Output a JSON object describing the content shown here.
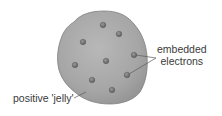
{
  "labels": {
    "electrons_line1": "embedded",
    "electrons_line2": "electrons",
    "jelly": "positive 'jelly'"
  },
  "colors": {
    "jelly_fill": "#a9a9a9",
    "jelly_outline": "#7d7d7d",
    "electron_fill": "#6f6f6f",
    "leader_line": "#5a5a5a",
    "text": "#3a3a3a"
  },
  "electrons": [
    {
      "x": 103,
      "y": 25
    },
    {
      "x": 119,
      "y": 34
    },
    {
      "x": 83,
      "y": 42
    },
    {
      "x": 134,
      "y": 55
    },
    {
      "x": 106,
      "y": 61
    },
    {
      "x": 75,
      "y": 65
    },
    {
      "x": 127,
      "y": 75
    },
    {
      "x": 92,
      "y": 80
    },
    {
      "x": 112,
      "y": 90
    }
  ]
}
